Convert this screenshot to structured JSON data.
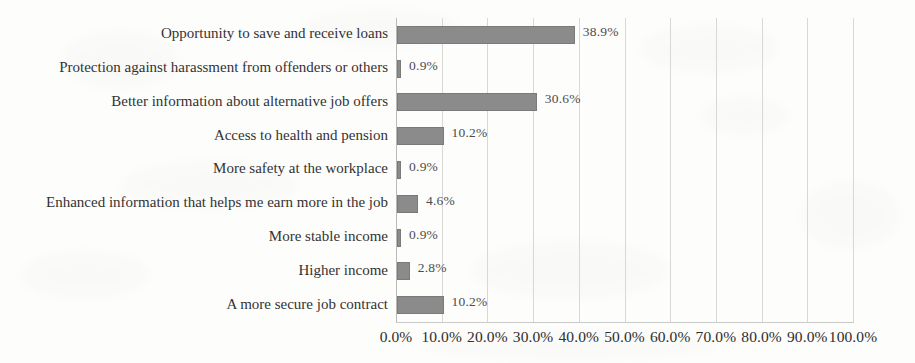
{
  "chart_data": {
    "type": "bar",
    "orientation": "horizontal",
    "title": "",
    "subtitle": "",
    "xlabel": "",
    "ylabel": "",
    "xlim": [
      0,
      100
    ],
    "grid": true,
    "legend": null,
    "legend_position": "none",
    "value_label_suffix": "%",
    "categories": [
      "Opportunity to save and receive loans",
      "Protection against harassment from offenders or others",
      "Better information about alternative job offers",
      "Access to health and pension",
      "More safety at the workplace",
      "Enhanced information that helps me earn more in the job",
      "More stable income",
      "Higher income",
      "A more secure job contract"
    ],
    "values": [
      38.9,
      0.9,
      30.6,
      10.2,
      0.9,
      4.6,
      0.9,
      2.8,
      10.2
    ],
    "value_labels": [
      "38.9%",
      "0.9%",
      "30.6%",
      "10.2%",
      "0.9%",
      "4.6%",
      "0.9%",
      "2.8%",
      "10.2%"
    ],
    "xticks": [
      0,
      10,
      20,
      30,
      40,
      50,
      60,
      70,
      80,
      90,
      100
    ],
    "xtick_labels": [
      "0.0%",
      "10.0%",
      "20.0%",
      "30.0%",
      "40.0%",
      "50.0%",
      "60.0%",
      "70.0%",
      "80.0%",
      "90.0%",
      "100.0%"
    ],
    "colors": {
      "bar": "#8b8b8b",
      "gridline": "#d8d8d6",
      "axis": "#b9b9b7",
      "label_text": "#333333",
      "value_text": "#4c4c4c",
      "background": "#fdfdfc"
    }
  }
}
